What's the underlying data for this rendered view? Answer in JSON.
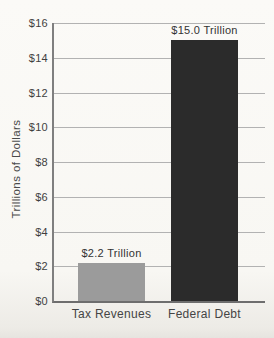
{
  "chart_data": {
    "type": "bar",
    "title": "",
    "xlabel": "",
    "ylabel": "Trillions of Dollars",
    "categories": [
      "Tax Revenues",
      "Federal Debt"
    ],
    "values": [
      2.2,
      15.0
    ],
    "value_labels": [
      "$2.2 Trillion",
      "$15.0 Trillion"
    ],
    "bar_colors": [
      "#9b9b9b",
      "#2b2b2b"
    ],
    "ylim": [
      0,
      16
    ],
    "ytick_step": 2,
    "ytick_labels": [
      "$0",
      "$2",
      "$4",
      "$6",
      "$8",
      "$10",
      "$12",
      "$14",
      "$16"
    ],
    "grid": "horizontal",
    "legend": "none",
    "colors": {
      "background": "#f8f7f3",
      "gridline": "#b2b2b2",
      "axis": "#7f7f7f",
      "text": "#3f3f3f"
    }
  }
}
